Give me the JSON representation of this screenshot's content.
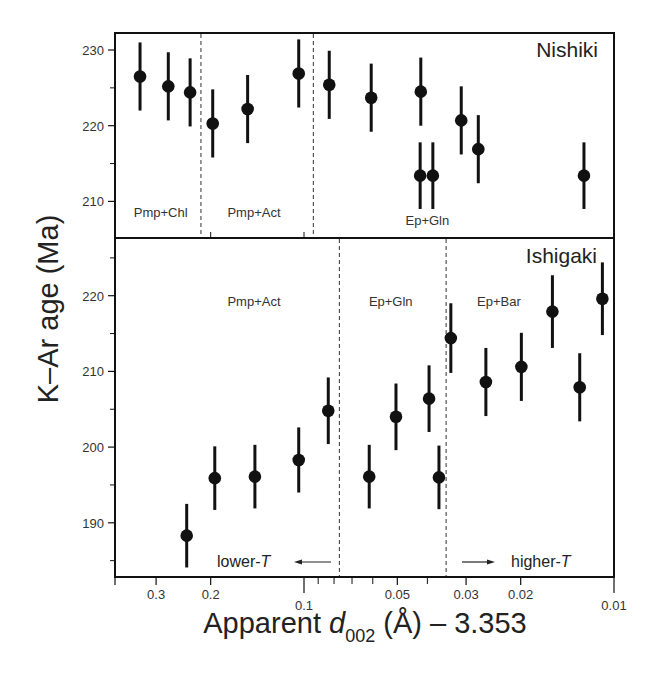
{
  "chart_data": {
    "type": "scatter",
    "title": "",
    "xlabel": "Apparent d002 (Å) − 3.353",
    "xlabel_parts": {
      "main": "Apparent ",
      "italic": "d",
      "sub": "002",
      "rest": " (Å) – 3.353"
    },
    "ylabel": "K–Ar age (Ma)",
    "x_scale": "log",
    "x_reversed": true,
    "xlim": [
      0.4,
      0.01
    ],
    "x_ticks": [
      0.3,
      0.2,
      0.1,
      0.05,
      0.03,
      0.02,
      0.01
    ],
    "x_tick_labels": [
      "0.3",
      "0.2",
      "0.1",
      "0.05",
      "0.03",
      "0.02",
      "0.01"
    ],
    "x_minor_ticks": [
      0.09,
      0.08,
      0.07,
      0.06,
      0.04
    ],
    "grid": false,
    "error_bars": "vertical, approx ±4.5 Ma",
    "panels": [
      {
        "name": "Nishiki",
        "ylim": [
          206,
          232.5
        ],
        "y_ticks": [
          210,
          220,
          230
        ],
        "y_minor_ticks": [
          215,
          225
        ],
        "zone_boundaries": [
          0.215,
          0.0933
        ],
        "zone_labels": [
          {
            "text": "Pmp+Chl",
            "x": 0.29,
            "y": 208.6
          },
          {
            "text": "Pmp+Act",
            "x": 0.145,
            "y": 208.6
          },
          {
            "text": "Ep+Gln",
            "x": 0.04,
            "y": 207.6
          }
        ],
        "points": [
          {
            "x": 0.338,
            "y": 226.5,
            "err": 4.5
          },
          {
            "x": 0.274,
            "y": 225.2,
            "err": 4.5
          },
          {
            "x": 0.233,
            "y": 224.4,
            "err": 4.5
          },
          {
            "x": 0.197,
            "y": 220.3,
            "err": 4.5
          },
          {
            "x": 0.152,
            "y": 222.2,
            "err": 4.5
          },
          {
            "x": 0.104,
            "y": 226.9,
            "err": 4.5
          },
          {
            "x": 0.0829,
            "y": 225.4,
            "err": 4.5
          },
          {
            "x": 0.0607,
            "y": 223.7,
            "err": 4.5
          },
          {
            "x": 0.042,
            "y": 224.5,
            "err": 4.5
          },
          {
            "x": 0.0311,
            "y": 220.7,
            "err": 4.5
          },
          {
            "x": 0.0274,
            "y": 216.9,
            "err": 4.5
          },
          {
            "x": 0.0422,
            "y": 213.4,
            "err": 4.4
          },
          {
            "x": 0.0384,
            "y": 213.4,
            "err": 4.4
          },
          {
            "x": 0.0125,
            "y": 213.4,
            "err": 4.4
          }
        ]
      },
      {
        "name": "Ishigaki",
        "ylim": [
          184,
          227.5
        ],
        "y_ticks": [
          190,
          200,
          210,
          220
        ],
        "y_minor_ticks": [
          185,
          195,
          205,
          215,
          225
        ],
        "zone_boundaries": [
          0.0769,
          0.0348
        ],
        "zone_labels": [
          {
            "text": "Pmp+Act",
            "x": 0.145,
            "y": 219.3
          },
          {
            "text": "Ep+Gln",
            "x": 0.0525,
            "y": 219.3
          },
          {
            "text": "Ep+Bar",
            "x": 0.0235,
            "y": 219.3
          }
        ],
        "points": [
          {
            "x": 0.239,
            "y": 188.3,
            "err": 4.2
          },
          {
            "x": 0.194,
            "y": 195.9,
            "err": 4.2
          },
          {
            "x": 0.144,
            "y": 196.1,
            "err": 4.2
          },
          {
            "x": 0.104,
            "y": 198.3,
            "err": 4.3
          },
          {
            "x": 0.0835,
            "y": 204.8,
            "err": 4.4
          },
          {
            "x": 0.0616,
            "y": 196.1,
            "err": 4.2
          },
          {
            "x": 0.0505,
            "y": 204.0,
            "err": 4.4
          },
          {
            "x": 0.0395,
            "y": 206.4,
            "err": 4.4
          },
          {
            "x": 0.0367,
            "y": 196.0,
            "err": 4.2
          },
          {
            "x": 0.0336,
            "y": 214.4,
            "err": 4.6
          },
          {
            "x": 0.0259,
            "y": 208.6,
            "err": 4.5
          },
          {
            "x": 0.0199,
            "y": 210.6,
            "err": 4.5
          },
          {
            "x": 0.0158,
            "y": 217.9,
            "err": 4.8
          },
          {
            "x": 0.0129,
            "y": 207.9,
            "err": 4.5
          },
          {
            "x": 0.0109,
            "y": 219.6,
            "err": 4.8
          }
        ]
      }
    ],
    "annotations": [
      {
        "text": "lower-",
        "italic": "T",
        "arrow": "left",
        "panel": "Ishigaki"
      },
      {
        "text": "higher-",
        "italic": "T",
        "arrow": "right",
        "panel": "Ishigaki"
      }
    ]
  },
  "labels": {
    "y_axis": "K–Ar age (Ma)",
    "x_axis_main": "Apparent ",
    "x_axis_italic": "d",
    "x_axis_sub": "002",
    "x_axis_rest": " (Å) – 3.353",
    "top_panel": "Nishiki",
    "bottom_panel": "Ishigaki",
    "lower_t": "lower-",
    "higher_t": "higher-",
    "t_symbol": "T"
  },
  "colors": {
    "ink": "#111111",
    "text": "#333333",
    "background": "#ffffff"
  }
}
